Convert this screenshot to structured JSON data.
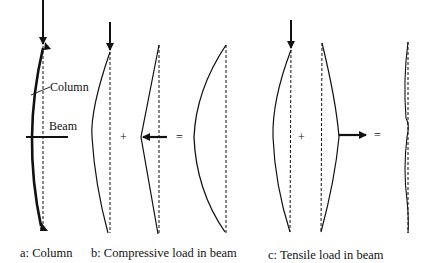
{
  "figure": {
    "panels": [
      {
        "id": "a",
        "caption": "a: Column",
        "labels": {
          "column": "Column",
          "beam": "Beam"
        }
      },
      {
        "id": "b",
        "caption": "b: Compressive load in beam",
        "operators": {
          "plus": "+",
          "equals": "="
        }
      },
      {
        "id": "c",
        "caption": "c: Tensile load in beam",
        "operators": {
          "plus": "+",
          "equals": "="
        }
      }
    ]
  }
}
